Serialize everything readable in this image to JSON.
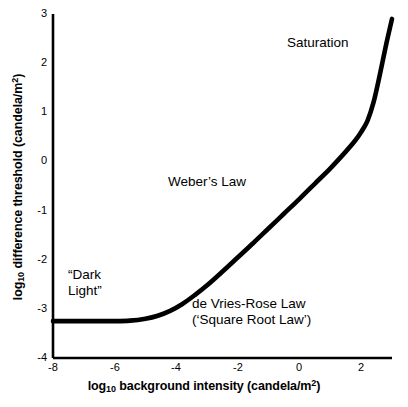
{
  "chart_data": {
    "type": "line",
    "title": "",
    "xlabel": "log10 background intensity (candela/m2)",
    "ylabel": "log10 difference threshold (candela/m2)",
    "xlabel_parts": {
      "prefix": "log",
      "sub": "10",
      "middle": " background intensity (candela/m",
      "sup": "2",
      "suffix": ")"
    },
    "ylabel_parts": {
      "prefix": "log",
      "sub": "10",
      "middle": " difference threshold (candela/m",
      "sup": "2",
      "suffix": ")"
    },
    "xlim": [
      -8,
      3
    ],
    "ylim": [
      -4,
      3
    ],
    "xticks": [
      "-8",
      "-6",
      "-4",
      "-2",
      "0",
      "2"
    ],
    "xtick_values": [
      -8,
      -6,
      -4,
      -2,
      0,
      2
    ],
    "yticks": [
      "3",
      "2",
      "1",
      "0",
      "-1",
      "-2",
      "-3",
      "-4"
    ],
    "ytick_values": [
      3,
      2,
      1,
      0,
      -1,
      -2,
      -3,
      -4
    ],
    "grid": false,
    "legend": "none",
    "series": [
      {
        "name": "threshold-vs-intensity (tvi) curve",
        "x": [
          -8.0,
          -7.0,
          -6.0,
          -5.5,
          -5.0,
          -4.6,
          -4.2,
          -3.8,
          -3.4,
          -3.0,
          -2.5,
          -2.0,
          -1.5,
          -1.0,
          -0.5,
          0.0,
          0.5,
          1.0,
          1.5,
          1.8,
          2.0,
          2.2,
          2.4,
          2.6,
          2.8,
          3.0
        ],
        "y": [
          -3.25,
          -3.25,
          -3.25,
          -3.24,
          -3.2,
          -3.14,
          -3.04,
          -2.9,
          -2.72,
          -2.52,
          -2.24,
          -1.95,
          -1.66,
          -1.36,
          -1.06,
          -0.76,
          -0.45,
          -0.14,
          0.2,
          0.42,
          0.6,
          0.82,
          1.2,
          1.75,
          2.35,
          2.9
        ]
      }
    ],
    "line_color": "#000000",
    "line_width": 4.6,
    "annotations": [
      {
        "id": "dark-light",
        "text_line1": "“Dark",
        "text_line2": "Light”",
        "x": 68,
        "y": 267
      },
      {
        "id": "de-vries-rose",
        "text_line1": "de Vries-Rose Law",
        "text_line2": "(‘Square Root Law’)",
        "x": 192,
        "y": 296
      },
      {
        "id": "webers-law",
        "text_line1": "Weber’s Law",
        "text_line2": "",
        "x": 168,
        "y": 174
      },
      {
        "id": "saturation",
        "text_line1": "Saturation",
        "text_line2": "",
        "x": 287,
        "y": 35
      }
    ]
  },
  "geometry": {
    "plot_left": 53,
    "plot_right": 392,
    "plot_top": 14,
    "plot_bottom": 358,
    "axis_width": 2.6,
    "axis_color": "#000000"
  }
}
